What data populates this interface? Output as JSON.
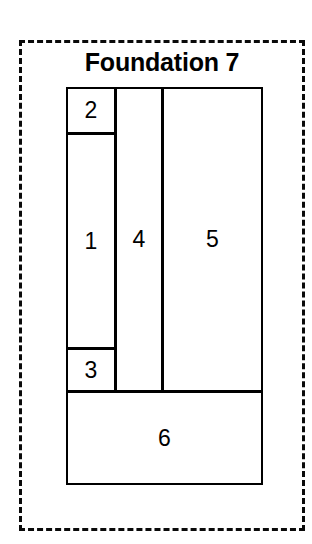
{
  "diagram": {
    "title": "Foundation 7",
    "background_color": "#ffffff",
    "line_color": "#000000",
    "boundary": {
      "name": "foundation-boundary",
      "style": "dashed"
    },
    "cells": [
      {
        "id": "cell-1",
        "label": "1"
      },
      {
        "id": "cell-2",
        "label": "2"
      },
      {
        "id": "cell-3",
        "label": "3"
      },
      {
        "id": "cell-4",
        "label": "4"
      },
      {
        "id": "cell-5",
        "label": "5"
      },
      {
        "id": "cell-6",
        "label": "6"
      }
    ]
  },
  "chart_data": {
    "type": "diagram",
    "title": "Foundation 7",
    "subtitle": "",
    "xlabel": "",
    "ylabel": "",
    "units": "px",
    "canvas": {
      "width": 312,
      "height": 544
    },
    "boundary": {
      "style": "dashed",
      "color": "#000000",
      "x": 19,
      "y": 40,
      "width": 286,
      "height": 491
    },
    "categories": [
      "1",
      "2",
      "3",
      "4",
      "5",
      "6"
    ],
    "values": [
      10800,
      2350,
      2200,
      14640,
      30805,
      18518
    ],
    "rectangles": [
      {
        "label": "2",
        "x": 66,
        "y": 87,
        "width": 50,
        "height": 47,
        "area": 2350
      },
      {
        "label": "1",
        "x": 66,
        "y": 133,
        "width": 50,
        "height": 216,
        "area": 10800
      },
      {
        "label": "3",
        "x": 66,
        "y": 348,
        "width": 50,
        "height": 44,
        "area": 2200
      },
      {
        "label": "4",
        "x": 115,
        "y": 87,
        "width": 48,
        "height": 305,
        "area": 14640
      },
      {
        "label": "5",
        "x": 162,
        "y": 87,
        "width": 101,
        "height": 305,
        "area": 30805
      },
      {
        "label": "6",
        "x": 66,
        "y": 391,
        "width": 197,
        "height": 94,
        "area": 18518
      }
    ],
    "grid": false,
    "legend": "none"
  }
}
